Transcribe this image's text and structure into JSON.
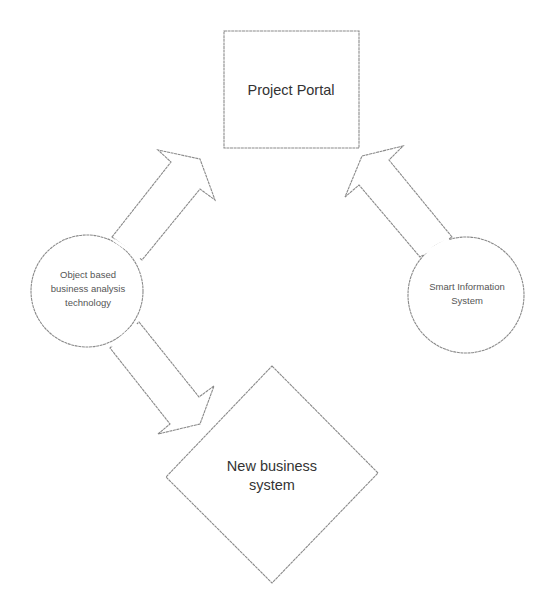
{
  "diagram": {
    "nodes": {
      "project_portal": {
        "shape": "rectangle",
        "label": "Project Portal"
      },
      "object_based": {
        "shape": "circle",
        "lines": [
          "Object based",
          "business analysis",
          "technology"
        ]
      },
      "smart_info": {
        "shape": "circle",
        "lines": [
          "Smart Information",
          "System"
        ]
      },
      "new_business": {
        "shape": "diamond",
        "lines": [
          "New business",
          "system"
        ]
      }
    },
    "edges": [
      {
        "from": "Object based business analysis technology",
        "to": "Project Portal",
        "style": "block-arrow"
      },
      {
        "from": "Object based business analysis technology",
        "to": "New business system",
        "style": "block-arrow"
      },
      {
        "from": "Smart Information System",
        "to": "Project Portal",
        "style": "block-arrow"
      }
    ],
    "colors": {
      "stroke": "#8a8a8a",
      "text": "#333333",
      "background": "#ffffff"
    }
  }
}
